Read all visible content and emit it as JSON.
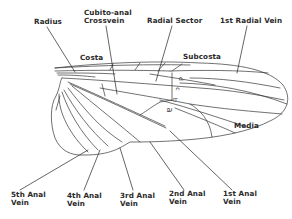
{
  "diagram": {
    "colors": {
      "line": "#333333",
      "text": "#2a2a2a",
      "background": "#ffffff"
    },
    "labels_top": [
      {
        "id": "radius",
        "text": "Radius",
        "lines": [
          "Radius"
        ]
      },
      {
        "id": "cubito-anal-crossvein",
        "text": "Cubito-anal Crossvein",
        "lines": [
          "Cubito-anal",
          "Crossvein"
        ]
      },
      {
        "id": "radial-sector",
        "text": "Radial Sector",
        "lines": [
          "Radial Sector"
        ]
      },
      {
        "id": "first-radial-vein",
        "text": "1st Radial Vein",
        "lines": [
          "1st Radial Vein"
        ]
      }
    ],
    "labels_inner": [
      {
        "id": "costa",
        "text": "Costa"
      },
      {
        "id": "subcosta",
        "text": "Subcosta"
      },
      {
        "id": "media",
        "text": "Media"
      }
    ],
    "cell_letters": [
      "d",
      "c",
      "b",
      "a"
    ],
    "labels_bottom": [
      {
        "id": "fifth-anal-vein",
        "lines": [
          "5th Anal",
          "Vein"
        ]
      },
      {
        "id": "fourth-anal-vein",
        "lines": [
          "4th Anal",
          "Vein"
        ]
      },
      {
        "id": "third-anal-vein",
        "lines": [
          "3rd Anal",
          "Vein"
        ]
      },
      {
        "id": "second-anal-vein",
        "lines": [
          "2nd Anal",
          "Vein"
        ]
      },
      {
        "id": "first-anal-vein",
        "lines": [
          "1st Anal",
          "Vein"
        ]
      }
    ]
  }
}
